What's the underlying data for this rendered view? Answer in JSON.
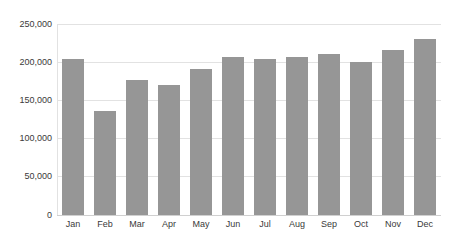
{
  "chart_data": {
    "type": "bar",
    "title": "",
    "subtitle": "",
    "xlabel": "",
    "ylabel": "",
    "categories": [
      "Jan",
      "Feb",
      "Mar",
      "Apr",
      "May",
      "Jun",
      "Jul",
      "Aug",
      "Sep",
      "Oct",
      "Nov",
      "Dec"
    ],
    "values": [
      204000,
      136000,
      176000,
      170000,
      190000,
      206000,
      204000,
      206000,
      210000,
      199000,
      215000,
      230000
    ],
    "ylim": [
      0,
      250000
    ],
    "yticks": [
      0,
      50000,
      100000,
      150000,
      200000,
      250000
    ],
    "ytick_labels": [
      "0",
      "50,000",
      "100,000",
      "150,000",
      "200,000",
      "250,000"
    ],
    "grid": true,
    "legend": false,
    "legend_position": "none",
    "bar_color": "#969696",
    "gridline_color": "#e2e2e2",
    "background_color": "#ffffff",
    "axis_text_color": "#3a3a3a"
  }
}
